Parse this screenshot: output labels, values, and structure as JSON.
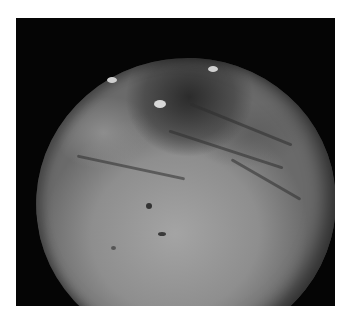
{
  "image": {
    "subject": "moon-surface-photograph",
    "description": "Grayscale photo of a cratered moon disc against black space, with a dark region near the top",
    "colors": {
      "background": "#ffffff",
      "space": "#050505",
      "surface_light": "#a4a4a4",
      "surface_dark": "#3a3a3a"
    }
  }
}
